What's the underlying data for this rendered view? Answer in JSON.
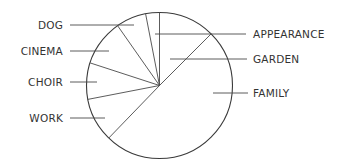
{
  "diagram": {
    "type": "pie-with-leader-labels",
    "center": [
      159.5,
      85.5
    ],
    "radius": 73,
    "colors": {
      "outline": "#3a3a3a",
      "lines": "#4a4a4a",
      "text": "#333333",
      "background": "#ffffff"
    }
  },
  "chart_data": {
    "type": "pie",
    "title": "",
    "slices": [
      {
        "label": "APPEARANCE",
        "start_deg": 349,
        "end_deg": 360,
        "value_pct": 3
      },
      {
        "label": "GARDEN",
        "start_deg": 0,
        "end_deg": 45,
        "value_pct": 12.5
      },
      {
        "label": "FAMILY",
        "start_deg": 45,
        "end_deg": 224,
        "value_pct": 50
      },
      {
        "label": "WORK",
        "start_deg": 224,
        "end_deg": 259,
        "value_pct": 10
      },
      {
        "label": "CHOIR",
        "start_deg": 259,
        "end_deg": 288,
        "value_pct": 8
      },
      {
        "label": "CINEMA",
        "start_deg": 288,
        "end_deg": 325,
        "value_pct": 10
      },
      {
        "label": "DOG",
        "start_deg": 325,
        "end_deg": 349,
        "value_pct": 6.5
      }
    ],
    "categories": [
      "APPEARANCE",
      "GARDEN",
      "FAMILY",
      "WORK",
      "CHOIR",
      "CINEMA",
      "DOG"
    ],
    "values": [
      3,
      12.5,
      50,
      10,
      8,
      10,
      6.5
    ],
    "fills": "none (outline only)",
    "legend": "none (leader-line labels)"
  },
  "labels": {
    "dog": {
      "text": "DOG",
      "side": "left",
      "y": 25,
      "line_from": [
        70,
        25
      ],
      "line_to": [
        134,
        25
      ]
    },
    "cinema": {
      "text": "CINEMA",
      "side": "left",
      "y": 51,
      "line_from": [
        70,
        51
      ],
      "line_to": [
        109,
        51
      ]
    },
    "choir": {
      "text": "CHOIR",
      "side": "left",
      "y": 82,
      "line_from": [
        70,
        82
      ],
      "line_to": [
        97,
        82
      ]
    },
    "work": {
      "text": "WORK",
      "side": "left",
      "y": 118,
      "line_from": [
        70,
        118
      ],
      "line_to": [
        105,
        118
      ]
    },
    "appearance": {
      "text": "APPEARANCE",
      "side": "right",
      "y": 34,
      "line_from": [
        155,
        34
      ],
      "line_to": [
        246,
        34
      ]
    },
    "garden": {
      "text": "GARDEN",
      "side": "right",
      "y": 59,
      "line_from": [
        170,
        59
      ],
      "line_to": [
        247,
        59
      ]
    },
    "family": {
      "text": "FAMILY",
      "side": "right",
      "y": 93,
      "line_from": [
        213,
        93
      ],
      "line_to": [
        248,
        93
      ]
    }
  }
}
